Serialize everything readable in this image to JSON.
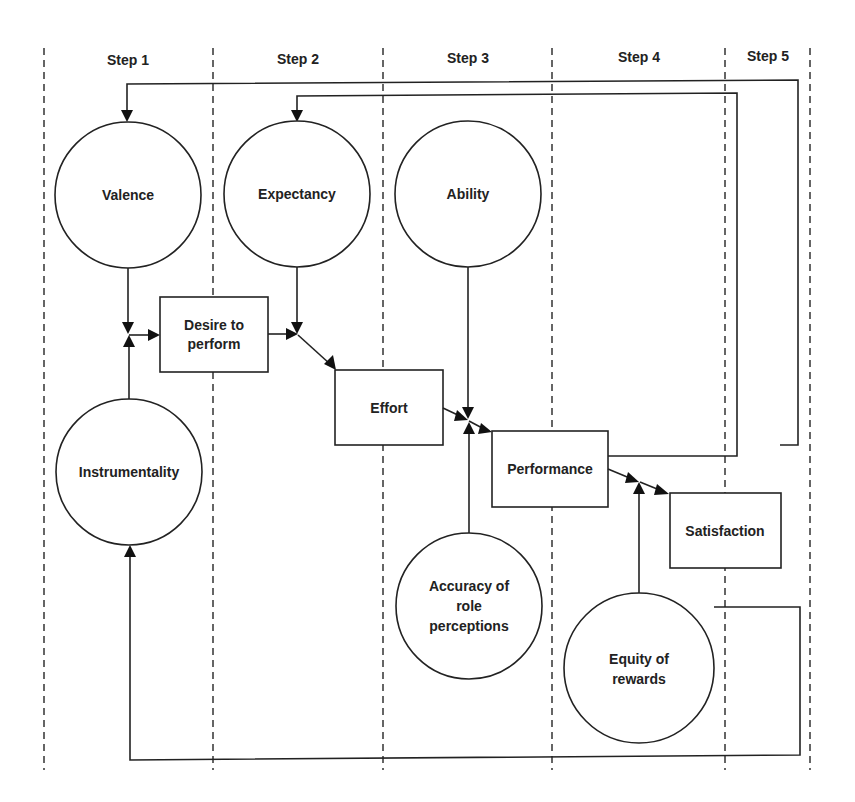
{
  "steps": [
    {
      "label": "Step 1"
    },
    {
      "label": "Step 2"
    },
    {
      "label": "Step 3"
    },
    {
      "label": "Step 4"
    },
    {
      "label": "Step 5"
    }
  ],
  "nodes": {
    "valence": {
      "label": "Valence",
      "shape": "circle"
    },
    "expectancy": {
      "label": "Expectancy",
      "shape": "circle"
    },
    "ability": {
      "label": "Ability",
      "shape": "circle"
    },
    "instrumentality": {
      "label": "Instrumentality",
      "shape": "circle"
    },
    "desire": {
      "label_line1": "Desire to",
      "label_line2": "perform",
      "shape": "box"
    },
    "effort": {
      "label": "Effort",
      "shape": "box"
    },
    "performance": {
      "label": "Performance",
      "shape": "box"
    },
    "satisfaction": {
      "label": "Satisfaction",
      "shape": "box"
    },
    "accuracy": {
      "label_line1": "Accuracy of",
      "label_line2": "role",
      "label_line3": "perceptions",
      "shape": "circle"
    },
    "equity": {
      "label_line1": "Equity of",
      "label_line2": "rewards",
      "shape": "circle"
    }
  },
  "edges": [
    {
      "from": "Valence",
      "to": "Desire to perform"
    },
    {
      "from": "Instrumentality",
      "to": "Desire to perform"
    },
    {
      "from": "Desire to perform",
      "to": "Effort"
    },
    {
      "from": "Expectancy",
      "to": "Effort"
    },
    {
      "from": "Effort",
      "to": "Performance"
    },
    {
      "from": "Ability",
      "to": "Performance"
    },
    {
      "from": "Accuracy of role perceptions",
      "to": "Performance"
    },
    {
      "from": "Performance",
      "to": "Satisfaction"
    },
    {
      "from": "Equity of rewards",
      "to": "Satisfaction"
    },
    {
      "from": "Performance",
      "to": "Expectancy"
    },
    {
      "from": "Satisfaction",
      "to": "Valence"
    },
    {
      "from": "Equity of rewards",
      "to": "Instrumentality"
    }
  ]
}
